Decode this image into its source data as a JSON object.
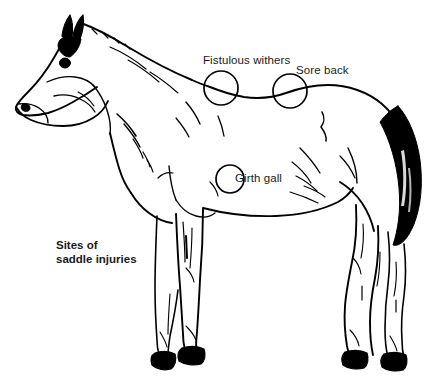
{
  "figure": {
    "title": "Sites of saddle injuries",
    "background_color": "#ffffff",
    "ink_color": "#000000"
  },
  "caption": {
    "line1": "Sites of",
    "line2": "saddle injuries"
  },
  "markers": [
    {
      "id": "fistulous-withers",
      "label": "Fistulous withers",
      "shape": "circle",
      "cx": 221,
      "cy": 88,
      "r": 17
    },
    {
      "id": "sore-back",
      "label": "Sore back",
      "shape": "circle",
      "cx": 290,
      "cy": 91,
      "r": 17
    },
    {
      "id": "girth-gall",
      "label": "Girth gall",
      "shape": "circle",
      "cx": 230,
      "cy": 179,
      "r": 14
    }
  ]
}
